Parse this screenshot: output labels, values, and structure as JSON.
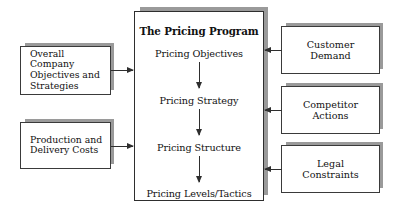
{
  "diagram": {
    "center": {
      "title": "The Pricing Program",
      "steps": [
        "Pricing Objectives",
        "Pricing Strategy",
        "Pricing Structure",
        "Pricing Levels/Tactics"
      ]
    },
    "left_boxes": [
      {
        "label": "Overall Company\nObjectives and\nStrategies"
      },
      {
        "label": "Production and\nDelivery Costs"
      }
    ],
    "right_boxes": [
      {
        "label": "Customer\nDemand"
      },
      {
        "label": "Competitor\nActions"
      },
      {
        "label": "Legal\nConstraints"
      }
    ],
    "colors": {
      "background": "#ffffff",
      "border": "#2e2e2e",
      "shadow": "#9a9a9a",
      "text": "#111111"
    }
  }
}
